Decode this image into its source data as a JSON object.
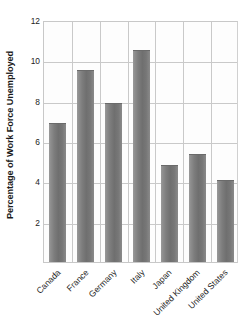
{
  "chart_data": {
    "type": "bar",
    "title": "",
    "xlabel": "",
    "ylabel": "Percentage of Work Force Unemployed",
    "categories": [
      "Canada",
      "France",
      "Germany",
      "Italy",
      "Japan",
      "United Kingdom",
      "United States"
    ],
    "values": [
      6.9,
      9.5,
      7.9,
      10.5,
      4.8,
      5.35,
      4.05
    ],
    "ylim": [
      0,
      12
    ],
    "yticks": [
      2,
      4,
      6,
      8,
      10,
      12
    ],
    "ytick_labels": [
      "2",
      "4",
      "6",
      "8",
      "10",
      "12"
    ],
    "grid": "both",
    "legend": "none",
    "bar_color": "#7a7a7a",
    "gridline_color": "#c9c9c9",
    "plot_background": "#fdfdfd",
    "xtick_rotation_degrees": -45
  },
  "axis": {
    "y_title": "Percentage of Work Force Unemployed"
  }
}
